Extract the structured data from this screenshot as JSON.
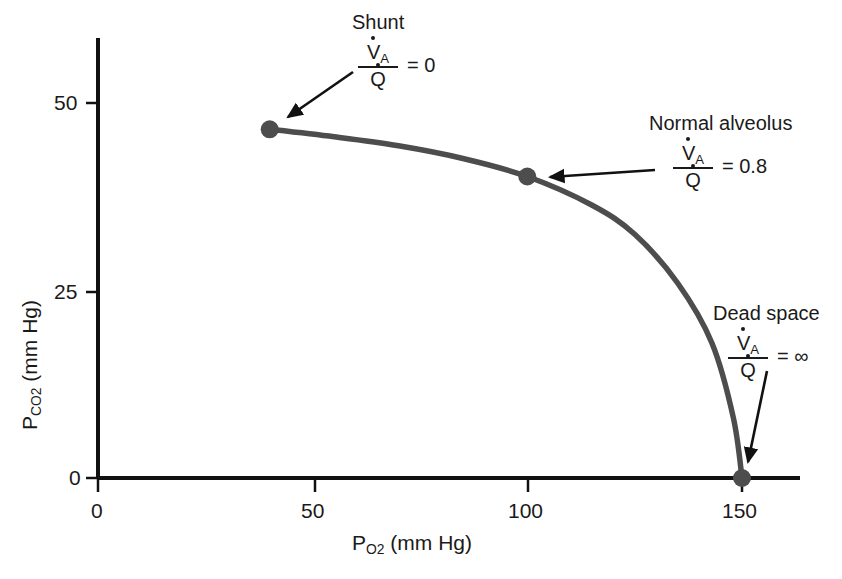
{
  "chart_data": {
    "type": "line",
    "title": "",
    "xlabel": "P O2 (mm Hg)",
    "ylabel": "P CO2 (mm Hg)",
    "xlim": [
      0,
      165
    ],
    "ylim": [
      0,
      58
    ],
    "grid": false,
    "legend_position": "none",
    "x_ticks": [
      "0",
      "50",
      "100",
      "150"
    ],
    "x_tick_values": [
      0,
      50,
      100,
      150
    ],
    "y_ticks": [
      "0",
      "25",
      "50"
    ],
    "y_tick_values": [
      0,
      25,
      50
    ],
    "series": [
      {
        "name": "Ventilation-perfusion ratio line",
        "x": [
          40,
          55,
          70,
          85,
          100,
          115,
          125,
          135,
          143,
          148,
          150
        ],
        "y": [
          46.5,
          45.5,
          44.3,
          42.6,
          40.2,
          36.4,
          32.5,
          26.0,
          18.0,
          8.0,
          0
        ]
      }
    ],
    "points": [
      {
        "label": "Shunt",
        "x": 40,
        "y": 46.5,
        "ratio": "0"
      },
      {
        "label": "Normal alveolus",
        "x": 100,
        "y": 40.2,
        "ratio": "0.8"
      },
      {
        "label": "Dead space",
        "x": 150,
        "y": 0,
        "ratio": "∞"
      }
    ]
  },
  "axes": {
    "x": {
      "label_main": "P",
      "label_sub": "O",
      "label_sub2": "2",
      "label_unit": " (mm Hg)",
      "ticks": [
        {
          "value": 0,
          "text": "0"
        },
        {
          "value": 50,
          "text": "50"
        },
        {
          "value": 100,
          "text": "100"
        },
        {
          "value": 150,
          "text": "150"
        }
      ]
    },
    "y": {
      "label_main": "P",
      "label_sub": "CO",
      "label_sub2": "2",
      "label_unit": " (mm Hg)",
      "ticks": [
        {
          "value": 0,
          "text": "0"
        },
        {
          "value": 25,
          "text": "25"
        },
        {
          "value": 50,
          "text": "50"
        }
      ]
    }
  },
  "annotations": {
    "shunt": {
      "title": "Shunt",
      "numerator": "V",
      "numerator_sub": "A",
      "denominator": "Q",
      "equals": "= 0"
    },
    "normal": {
      "title": "Normal alveolus",
      "numerator": "V",
      "numerator_sub": "A",
      "denominator": "Q",
      "equals": "= 0.8"
    },
    "deadspace": {
      "title": "Dead space",
      "numerator": "V",
      "numerator_sub": "A",
      "denominator": "Q",
      "equals": "= ∞"
    }
  },
  "colors": {
    "curve": "#4d4d4d",
    "axis": "#111111",
    "text": "#1a1a1a",
    "marker": "#4d4d4d",
    "background": "#ffffff"
  }
}
